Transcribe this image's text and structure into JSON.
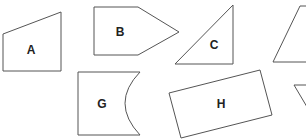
{
  "diagram": {
    "background": "#ffffff",
    "stroke_color": "#555555",
    "label_color": "#222222",
    "shapes": [
      {
        "id": "A",
        "label": "A",
        "type": "trapezoid",
        "points": "3,34 61,12 61,71 3,71",
        "label_pos": [
          31,
          50
        ]
      },
      {
        "id": "B",
        "label": "B",
        "type": "pentagon",
        "points": "94,7 138,7 179,32 138,55 94,55",
        "label_pos": [
          120,
          33
        ]
      },
      {
        "id": "C",
        "label": "C",
        "type": "right-triangle",
        "points": "233,5 233,64 175,64",
        "label_pos": [
          214,
          45
        ]
      },
      {
        "id": "D",
        "label": "",
        "type": "partial-quadrilateral",
        "points": "300,6 310,6 310,62 273,62",
        "label_pos": null
      },
      {
        "id": "G",
        "label": "G",
        "type": "concave-quadrilateral",
        "label_pos": [
          102,
          104
        ]
      },
      {
        "id": "H",
        "label": "H",
        "type": "rotated-rectangle",
        "points": "169,93 260,70 272,115 181,138",
        "label_pos": [
          221,
          104
        ]
      },
      {
        "id": "I",
        "label": "",
        "type": "partial-triangle",
        "points": "294,85 310,85 310,112",
        "label_pos": null
      }
    ]
  }
}
